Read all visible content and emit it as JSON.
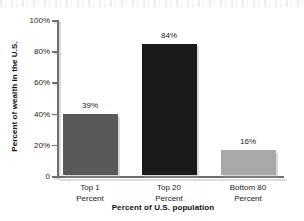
{
  "chart_data": {
    "type": "bar",
    "title": "",
    "xlabel": "Percent of U.S. population",
    "ylabel": "Percent of wealth in the U.S.",
    "categories": [
      "Top 1 Percent",
      "Top 20 Percent",
      "Bottom 80 Percent"
    ],
    "category_lines": [
      [
        "Top 1",
        "Percent"
      ],
      [
        "Top 20",
        "Percent"
      ],
      [
        "Bottom 80",
        "Percent"
      ]
    ],
    "values": [
      39,
      84,
      16
    ],
    "value_labels": [
      "39%",
      "84%",
      "16%"
    ],
    "bar_colors": [
      "#595959",
      "#1a1a1a",
      "#a8a8a8"
    ],
    "ylim": [
      0,
      100
    ],
    "ytick_values": [
      0,
      20,
      40,
      60,
      80,
      100
    ],
    "ytick_labels": [
      "0",
      "20%",
      "40%",
      "60%",
      "80%",
      "100%"
    ],
    "grid": false,
    "legend": false
  },
  "colors": {
    "axis": "#6f6f6f",
    "text": "#1a1a1a",
    "background": "#ffffff"
  }
}
